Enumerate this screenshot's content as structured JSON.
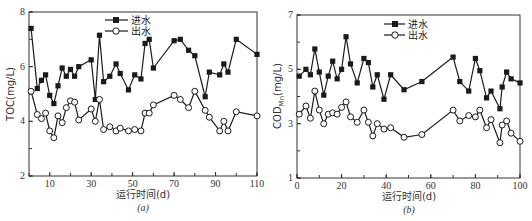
{
  "chart_data": [
    {
      "type": "line",
      "panel": "(a)",
      "title": "",
      "xlabel": "运行时间(d)",
      "ylabel": "TOC(mg/L)",
      "xlim": [
        0,
        110
      ],
      "ylim": [
        2,
        8
      ],
      "xticks": [
        10,
        30,
        50,
        70,
        90,
        110
      ],
      "yticks": [
        2,
        4,
        6,
        8
      ],
      "legend_position": "upper center",
      "grid": false,
      "series": [
        {
          "name": "进水",
          "marker": "filled-square",
          "x": [
            1,
            4,
            6,
            8,
            10,
            12,
            14,
            16,
            18,
            20,
            22,
            24,
            30,
            32,
            34,
            36,
            39,
            42,
            44,
            48,
            51,
            54,
            56,
            58,
            60,
            70,
            73,
            77,
            80,
            85,
            87,
            92,
            94,
            96,
            100,
            110
          ],
          "values": [
            7.4,
            5.2,
            5.5,
            5.7,
            4.95,
            4.65,
            5.3,
            5.95,
            5.65,
            5.9,
            5.65,
            6.0,
            6.25,
            4.8,
            7.15,
            5.45,
            5.65,
            6.1,
            5.75,
            5.15,
            5.7,
            5.55,
            6.85,
            7.0,
            5.95,
            6.95,
            7.0,
            6.6,
            6.4,
            4.9,
            5.8,
            5.7,
            6.1,
            5.8,
            7.0,
            6.45
          ]
        },
        {
          "name": "出水",
          "marker": "open-circle",
          "x": [
            1,
            4,
            6,
            8,
            10,
            12,
            14,
            16,
            18,
            20,
            22,
            24,
            30,
            32,
            34,
            36,
            39,
            42,
            44,
            48,
            51,
            54,
            56,
            58,
            60,
            70,
            73,
            77,
            80,
            85,
            87,
            92,
            94,
            96,
            100,
            110
          ],
          "values": [
            5.1,
            4.25,
            4.1,
            4.3,
            3.65,
            3.4,
            4.2,
            3.95,
            4.5,
            4.75,
            4.7,
            4.05,
            4.45,
            4.0,
            4.8,
            3.7,
            3.8,
            3.65,
            3.75,
            3.65,
            3.7,
            3.65,
            4.3,
            4.3,
            4.6,
            4.95,
            4.8,
            4.5,
            5.1,
            4.4,
            4.15,
            3.65,
            4.0,
            3.65,
            4.35,
            4.2
          ]
        }
      ]
    },
    {
      "type": "line",
      "panel": "(b)",
      "title": "",
      "xlabel": "运行时间(d)",
      "ylabel": "COD_Mn(mg/L)",
      "xlim": [
        0,
        100
      ],
      "ylim": [
        1,
        7
      ],
      "xticks": [
        0,
        20,
        40,
        60,
        80,
        100
      ],
      "yticks": [
        1,
        3,
        5,
        7
      ],
      "legend_position": "upper center",
      "grid": false,
      "series": [
        {
          "name": "进水",
          "marker": "filled-square",
          "x": [
            1,
            4,
            6,
            8,
            10,
            12,
            14,
            16,
            18,
            20,
            22,
            24,
            27,
            30,
            32,
            34,
            36,
            39,
            42,
            48,
            56,
            70,
            73,
            77,
            80,
            82,
            85,
            87,
            91,
            92,
            94,
            96,
            100
          ],
          "values": [
            4.75,
            5.0,
            4.8,
            5.75,
            4.9,
            4.05,
            4.75,
            5.3,
            4.65,
            5.0,
            6.2,
            5.2,
            4.5,
            5.4,
            5.25,
            4.35,
            4.8,
            3.9,
            4.8,
            4.25,
            4.55,
            5.45,
            4.55,
            4.2,
            5.4,
            4.95,
            3.95,
            4.2,
            3.55,
            4.35,
            4.9,
            4.65,
            4.5
          ]
        },
        {
          "name": "出水",
          "marker": "open-circle",
          "x": [
            1,
            4,
            6,
            8,
            10,
            12,
            14,
            16,
            18,
            20,
            22,
            24,
            27,
            30,
            32,
            34,
            36,
            39,
            42,
            48,
            56,
            70,
            73,
            77,
            80,
            82,
            85,
            87,
            91,
            92,
            94,
            96,
            100
          ],
          "values": [
            3.35,
            3.65,
            3.2,
            4.2,
            3.5,
            3.0,
            3.35,
            3.4,
            3.35,
            3.6,
            3.8,
            3.25,
            3.05,
            3.5,
            3.05,
            2.55,
            3.0,
            2.8,
            2.85,
            2.5,
            2.6,
            3.5,
            3.1,
            3.3,
            3.25,
            3.5,
            2.85,
            3.15,
            2.3,
            2.95,
            3.1,
            2.65,
            2.35
          ]
        }
      ]
    }
  ],
  "panels": {
    "a": {
      "ylabel": "TOC(mg/L)",
      "xlabel": "运行时间(d)",
      "sub": "(a)",
      "legend": [
        "进水",
        "出水"
      ]
    },
    "b": {
      "ylabel_main": "COD",
      "ylabel_sub": "Mn",
      "ylabel_tail": "(mg/L)",
      "xlabel": "运行时间(d)",
      "sub": "(b)",
      "legend": [
        "进水",
        "出水"
      ]
    }
  },
  "colors": {
    "line": "#1a1a1a",
    "axis": "#333333",
    "background": "#ffffff"
  }
}
